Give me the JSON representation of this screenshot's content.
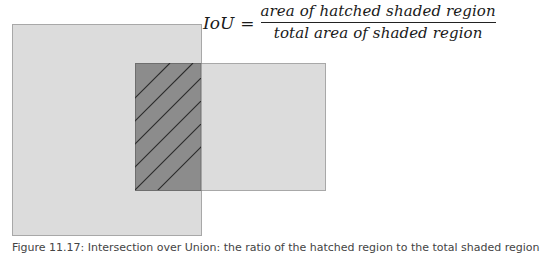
{
  "equation": {
    "lhs": "IoU",
    "equals": "=",
    "numerator": "area of hatched shaded region",
    "denominator": "total area of shaded region"
  },
  "diagram": {
    "rect_a": {
      "x": 12,
      "y": 24,
      "width": 189,
      "height": 211,
      "fill": "#dcdcdc",
      "stroke": "#a8a8a8"
    },
    "rect_b": {
      "x": 135,
      "y": 63,
      "width": 190,
      "height": 127,
      "fill": "#dcdcdc",
      "stroke": "#a8a8a8"
    },
    "intersection": {
      "x": 135,
      "y": 63,
      "width": 66,
      "height": 127,
      "fill": "#8c8c8c",
      "stroke": "#6e6e6e"
    },
    "hatch": {
      "angle_deg": 45,
      "count": 6,
      "color": "#2a2a2a",
      "spacing_px": 23
    }
  },
  "caption": {
    "text": "Figure 11.17: Intersection over Union: the ratio of the hatched region to the total shaded region"
  },
  "colors": {
    "light_fill": "#dcdcdc",
    "overlap_fill": "#8c8c8c",
    "hatch_line": "#2a2a2a",
    "text": "#1a1a1a"
  }
}
